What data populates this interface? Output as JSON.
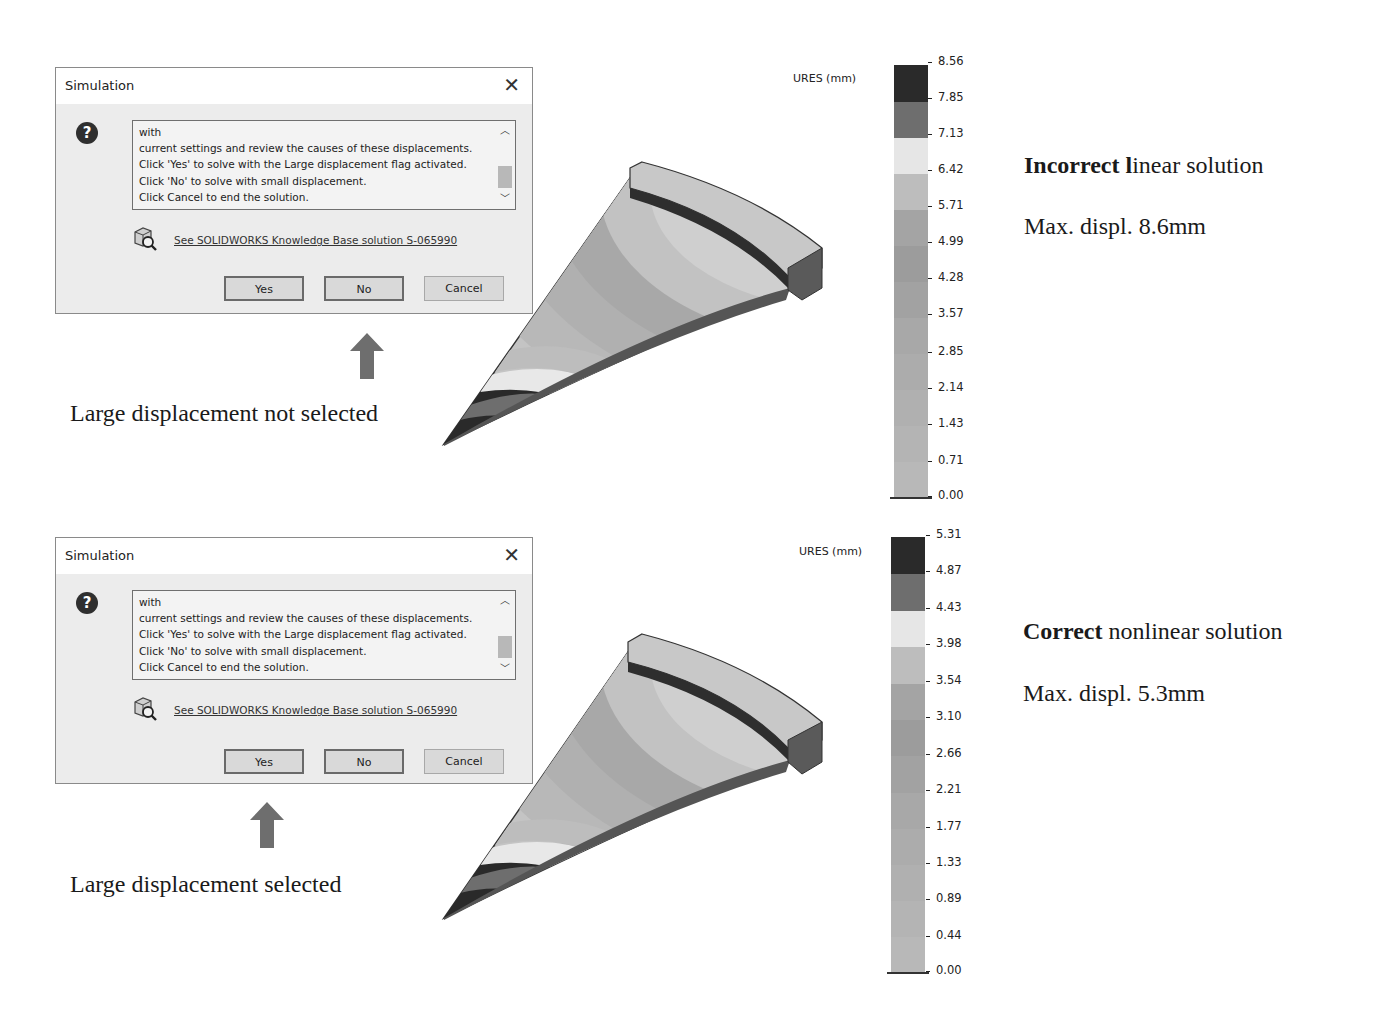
{
  "panels": [
    {
      "dialog": {
        "title": "Simulation",
        "close_glyph": "✕",
        "message_lines": [
          "with",
          "current settings and review the causes of these displacements.",
          "Click 'Yes' to solve with the Large displacement flag activated.",
          "Click 'No' to solve with small displacement.",
          "Click Cancel to end the solution."
        ],
        "kb_link": "See SOLIDWORKS Knowledge Base solution S-065990",
        "buttons": {
          "yes": "Yes",
          "no": "No",
          "cancel": "Cancel"
        }
      },
      "arrow_points_to": "No",
      "caption": "Large displacement not selected",
      "legend": {
        "label": "URES (mm)",
        "ticks": [
          "8.56",
          "7.85",
          "7.13",
          "6.42",
          "5.71",
          "4.99",
          "4.28",
          "3.57",
          "2.85",
          "2.14",
          "1.43",
          "0.71",
          "0.00"
        ]
      },
      "result": {
        "title_bold": "Incorrect l",
        "title_rest": "inear solution",
        "max": "Max. displ. 8.6mm"
      }
    },
    {
      "dialog": {
        "title": "Simulation",
        "close_glyph": "✕",
        "message_lines": [
          "with",
          "current settings and review the causes of these displacements.",
          "Click 'Yes' to solve with the Large displacement flag activated.",
          "Click 'No' to solve with small displacement.",
          "Click Cancel to end the solution."
        ],
        "kb_link": "See SOLIDWORKS Knowledge Base solution S-065990",
        "buttons": {
          "yes": "Yes",
          "no": "No",
          "cancel": "Cancel"
        }
      },
      "arrow_points_to": "Yes",
      "caption": "Large displacement selected",
      "legend": {
        "label": "URES (mm)",
        "ticks": [
          "5.31",
          "4.87",
          "4.43",
          "3.98",
          "3.54",
          "3.10",
          "2.66",
          "2.21",
          "1.77",
          "1.33",
          "0.89",
          "0.44",
          "0.00"
        ]
      },
      "result": {
        "title_bold": "Correct",
        "title_rest": " nonlinear solution",
        "max": "Max. displ. 5.3mm"
      }
    }
  ],
  "legend_colors": [
    "#2a2a2a",
    "#6e6e6e",
    "#e6e6e6",
    "#bdbdbd",
    "#a4a4a4",
    "#9c9c9c",
    "#a2a2a2",
    "#a8a8a8",
    "#acacac",
    "#b0b0b0",
    "#b4b4b4",
    "#b8b8b8"
  ],
  "colors": {
    "dialog_bg": "#ececec",
    "arrow": "#6e6e6e",
    "text": "#1a1a1a"
  }
}
